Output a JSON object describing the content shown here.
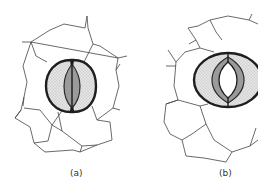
{
  "figure": {
    "panels": [
      {
        "id": "a",
        "label": "(a)",
        "state": "closed stoma"
      },
      {
        "id": "b",
        "label": "(b)",
        "state": "open stoma"
      }
    ],
    "colors": {
      "background": "#ffffff",
      "cell_wall": "#3a3a3a",
      "guard_cell_outline": "#1e1e1e",
      "guard_cell_fill": "#d8d8d8",
      "inner_wall_fill": "#9a9a9a"
    }
  }
}
